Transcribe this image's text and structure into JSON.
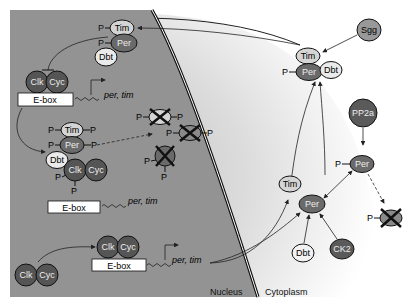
{
  "labels": {
    "nucleus": "Nucleus",
    "cytoplasm": "Cytoplasm",
    "gene": "per, tim",
    "ebox": "E-box",
    "p": "P"
  },
  "proteins": {
    "tim": "Tim",
    "per": "Per",
    "dbt": "Dbt",
    "clk": "Clk",
    "cyc": "Cyc",
    "sgg": "Sgg",
    "pp2a": "PP2a",
    "ck2": "CK2"
  },
  "colors": {
    "nucleus_fill": "#8f8f8f",
    "cytoplasm_fill": "#d8d8d8",
    "dark_protein": "#5a5a5a",
    "mid_protein": "#8a8a8a",
    "light_protein": "#d6d6d6",
    "outline": "#111111",
    "ebox_fill": "#ffffff"
  }
}
